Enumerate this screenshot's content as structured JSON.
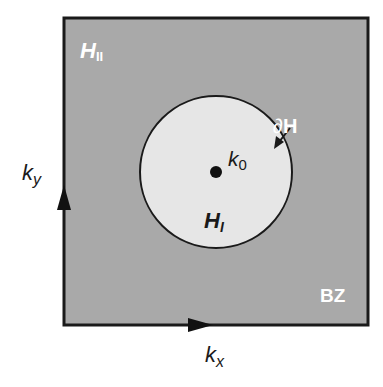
{
  "diagram": {
    "colors": {
      "background": "#ffffff",
      "brillouin_zone_fill": "#a9a9a9",
      "region_I_fill": "#e6e6e6",
      "stroke": "#1a1a1a",
      "inner_label_white": "#ffffff"
    },
    "labels": {
      "region_II": "H",
      "region_II_sub": "II",
      "region_I": "H",
      "region_I_sub": "I",
      "boundary_partial": "∂",
      "boundary_H": "H",
      "point": "k",
      "point_sub": "0",
      "zone": "BZ",
      "axis_x": "k",
      "axis_x_sub": "x",
      "axis_y": "k",
      "axis_y_sub": "y"
    }
  }
}
